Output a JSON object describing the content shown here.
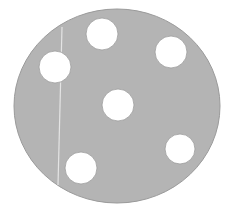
{
  "image": {
    "subject": "gray circular disc with six holes",
    "background_color": "#ffffff",
    "disc": {
      "cx": 117,
      "cy": 106,
      "rx": 103,
      "ry": 97,
      "fill": "#b4b4b4",
      "stroke": "#9a9a9a"
    },
    "holes": [
      {
        "name": "hole-top",
        "cx": 102,
        "cy": 34,
        "r": 16
      },
      {
        "name": "hole-upper-right",
        "cx": 171,
        "cy": 52,
        "r": 16
      },
      {
        "name": "hole-left",
        "cx": 55,
        "cy": 67,
        "r": 16
      },
      {
        "name": "hole-center",
        "cx": 118,
        "cy": 105,
        "r": 16
      },
      {
        "name": "hole-right",
        "cx": 180,
        "cy": 149,
        "r": 15
      },
      {
        "name": "hole-bottom-left",
        "cx": 81,
        "cy": 168,
        "r": 16
      }
    ],
    "scratch_line": {
      "x1": 62,
      "y1": 27,
      "x2": 58,
      "y2": 185,
      "color": "#e4e4e4"
    }
  }
}
